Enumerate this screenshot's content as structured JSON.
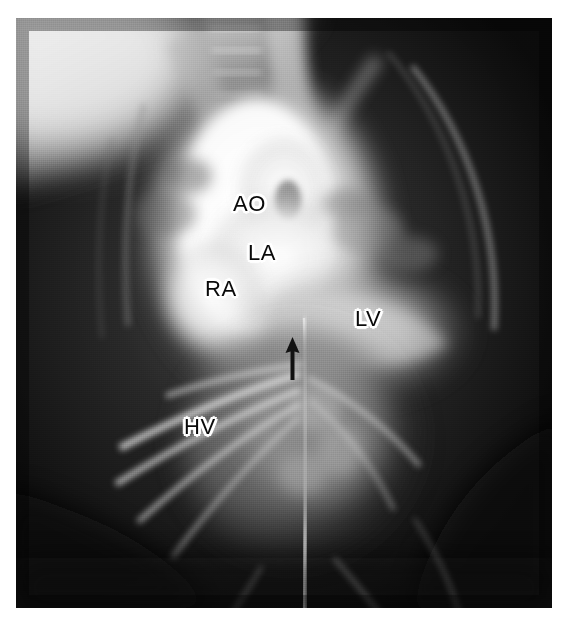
{
  "figure": {
    "modality": "angiogram",
    "view": "frontal",
    "background_color": "#ffffff",
    "plate_color": "#0d0d0d",
    "label_text_color": "#0a0a0a",
    "label_halo_color": "#ffffff"
  },
  "annotations": {
    "labels": [
      {
        "id": "ao",
        "text": "AO",
        "x": 233,
        "y": 193,
        "meaning": "aorta"
      },
      {
        "id": "la",
        "text": "LA",
        "x": 248,
        "y": 242,
        "meaning": "left atrium"
      },
      {
        "id": "ra",
        "text": "RA",
        "x": 205,
        "y": 278,
        "meaning": "right atrium"
      },
      {
        "id": "lv",
        "text": "LV",
        "x": 355,
        "y": 308,
        "meaning": "left ventricle"
      },
      {
        "id": "hv",
        "text": "HV",
        "x": 184,
        "y": 416,
        "meaning": "hepatic veins"
      }
    ],
    "markers": [
      {
        "id": "defect-arrow",
        "shape": "arrow",
        "direction": "up",
        "tip_x": 292,
        "tip_y": 338,
        "tail_y": 378,
        "color": "#111111"
      }
    ]
  }
}
